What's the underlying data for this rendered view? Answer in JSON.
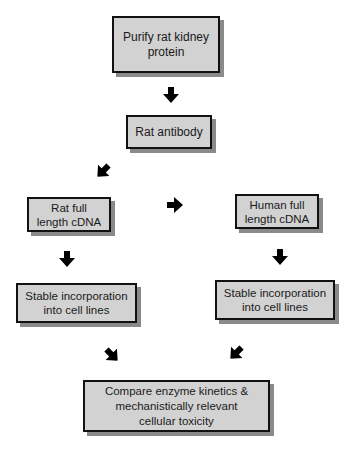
{
  "diagram": {
    "type": "flowchart",
    "nodes": [
      {
        "id": "purify",
        "label": "Purify rat kidney\nprotein"
      },
      {
        "id": "antibody",
        "label": "Rat antibody"
      },
      {
        "id": "rat_cdna",
        "label": "Rat full\nlength cDNA"
      },
      {
        "id": "human_cdna",
        "label": "Human full\nlength cDNA"
      },
      {
        "id": "rat_stable",
        "label": "Stable incorporation\ninto cell lines"
      },
      {
        "id": "human_stable",
        "label": "Stable incorporation\ninto cell lines"
      },
      {
        "id": "compare",
        "label": "Compare enzyme kinetics &\nmechanistically relevant\ncellular toxicity"
      }
    ],
    "edges": [
      {
        "from": "purify",
        "to": "antibody",
        "direction": "down"
      },
      {
        "from": "antibody",
        "to": "rat_cdna",
        "direction": "down-left"
      },
      {
        "from": "rat_cdna",
        "to": "human_cdna",
        "direction": "right"
      },
      {
        "from": "rat_cdna",
        "to": "rat_stable",
        "direction": "down"
      },
      {
        "from": "human_cdna",
        "to": "human_stable",
        "direction": "down"
      },
      {
        "from": "rat_stable",
        "to": "compare",
        "direction": "down-right"
      },
      {
        "from": "human_stable",
        "to": "compare",
        "direction": "down-left"
      }
    ],
    "colors": {
      "box_fill": "#d2d2d2",
      "box_border": "#111111",
      "box_shadow": "#8a8a8a",
      "arrow": "#000000"
    }
  }
}
